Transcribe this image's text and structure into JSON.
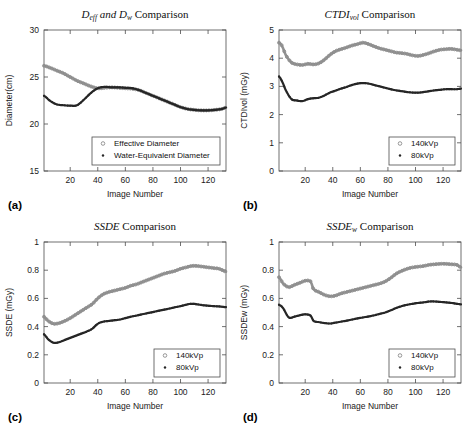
{
  "figure": {
    "panels": [
      "a",
      "b",
      "c",
      "d"
    ],
    "colors": {
      "series_140kvp": "#8c8c8c",
      "series_80kvp": "#262626",
      "effective_diameter": "#8c8c8c",
      "water_equivalent_diameter": "#262626",
      "axis": "#4d4d4d",
      "background": "#ffffff"
    },
    "common": {
      "xlabel": "Image Number",
      "xticks": [
        20,
        40,
        60,
        80,
        100,
        120
      ],
      "xlim": [
        1,
        133
      ]
    }
  },
  "chart_data": [
    {
      "panel_letter": "(a)",
      "type": "line",
      "title": "D_eff and D_w Comparison",
      "title_parts": {
        "main1": "D",
        "sub1": "eff",
        "mid": " and ",
        "main2": "D",
        "sub2": "w",
        "tail": " Comparison"
      },
      "xlabel": "Image Number",
      "ylabel": "Diameter(cm)",
      "xlim": [
        1,
        133
      ],
      "ylim": [
        15,
        30
      ],
      "xticks": [
        20,
        40,
        60,
        80,
        100,
        120
      ],
      "yticks": [
        15,
        20,
        25,
        30
      ],
      "grid": false,
      "legend_position": "lower right",
      "series": [
        {
          "name": "Effective Diameter",
          "marker": "circle",
          "color": "#8c8c8c",
          "x": [
            1,
            5,
            10,
            15,
            20,
            25,
            30,
            35,
            40,
            45,
            50,
            55,
            60,
            65,
            70,
            75,
            80,
            85,
            90,
            95,
            100,
            105,
            110,
            115,
            120,
            125,
            130,
            133
          ],
          "values": [
            26.2,
            26.0,
            25.7,
            25.4,
            25.0,
            24.6,
            24.3,
            24.0,
            23.8,
            23.85,
            23.9,
            23.85,
            23.8,
            23.75,
            23.6,
            23.3,
            23.0,
            22.7,
            22.4,
            22.1,
            21.8,
            21.6,
            21.5,
            21.45,
            21.45,
            21.5,
            21.6,
            21.75
          ]
        },
        {
          "name": "Water-Equivalent Diameter",
          "marker": "dot",
          "color": "#262626",
          "x": [
            1,
            5,
            10,
            15,
            20,
            25,
            30,
            35,
            40,
            45,
            50,
            55,
            60,
            65,
            70,
            75,
            80,
            85,
            90,
            95,
            100,
            105,
            110,
            115,
            120,
            125,
            130,
            133
          ],
          "values": [
            23.0,
            22.5,
            22.1,
            22.0,
            21.95,
            22.0,
            22.6,
            23.3,
            23.8,
            23.95,
            23.9,
            23.9,
            23.85,
            23.8,
            23.6,
            23.3,
            23.0,
            22.7,
            22.4,
            22.1,
            21.8,
            21.6,
            21.5,
            21.45,
            21.45,
            21.5,
            21.6,
            21.75
          ]
        }
      ]
    },
    {
      "panel_letter": "(b)",
      "type": "line",
      "title": "CTDI_vol Comparison",
      "title_parts": {
        "main1": "CTDI",
        "sub1": "vol",
        "tail": " Comparison"
      },
      "xlabel": "Image Number",
      "ylabel": "CTDIvol (mGy)",
      "xlim": [
        1,
        133
      ],
      "ylim": [
        0,
        5
      ],
      "xticks": [
        20,
        40,
        60,
        80,
        100,
        120
      ],
      "yticks": [
        0,
        1,
        2,
        3,
        4,
        5
      ],
      "grid": false,
      "legend_position": "lower right",
      "series": [
        {
          "name": "140kVp",
          "marker": "circle",
          "color": "#8c8c8c",
          "x": [
            1,
            3,
            6,
            10,
            14,
            18,
            22,
            26,
            30,
            34,
            38,
            42,
            46,
            50,
            54,
            58,
            62,
            66,
            70,
            74,
            78,
            82,
            86,
            90,
            94,
            98,
            102,
            106,
            110,
            114,
            118,
            122,
            126,
            130,
            133
          ],
          "values": [
            4.55,
            4.45,
            4.1,
            3.85,
            3.78,
            3.76,
            3.8,
            3.78,
            3.82,
            3.95,
            4.12,
            4.25,
            4.32,
            4.38,
            4.45,
            4.5,
            4.55,
            4.5,
            4.42,
            4.35,
            4.3,
            4.25,
            4.2,
            4.18,
            4.15,
            4.1,
            4.08,
            4.12,
            4.18,
            4.25,
            4.3,
            4.32,
            4.33,
            4.3,
            4.28
          ]
        },
        {
          "name": "80kVp",
          "marker": "dot",
          "color": "#262626",
          "x": [
            1,
            3,
            6,
            10,
            14,
            18,
            22,
            26,
            30,
            34,
            38,
            42,
            46,
            50,
            54,
            58,
            62,
            66,
            70,
            74,
            78,
            82,
            86,
            90,
            94,
            98,
            102,
            106,
            110,
            114,
            118,
            122,
            126,
            130,
            133
          ],
          "values": [
            3.35,
            3.2,
            2.85,
            2.55,
            2.5,
            2.48,
            2.55,
            2.58,
            2.6,
            2.68,
            2.78,
            2.85,
            2.92,
            2.98,
            3.05,
            3.1,
            3.12,
            3.1,
            3.05,
            3.0,
            2.95,
            2.9,
            2.86,
            2.83,
            2.8,
            2.78,
            2.78,
            2.8,
            2.83,
            2.86,
            2.88,
            2.9,
            2.9,
            2.9,
            2.92
          ]
        }
      ]
    },
    {
      "panel_letter": "(c)",
      "type": "line",
      "title": "SSDE Comparison",
      "title_parts": {
        "main1": "SSDE",
        "tail": " Comparison"
      },
      "xlabel": "Image Number",
      "ylabel": "SSDE (mGy)",
      "xlim": [
        1,
        133
      ],
      "ylim": [
        0,
        1
      ],
      "xticks": [
        20,
        40,
        60,
        80,
        100,
        120
      ],
      "yticks": [
        0,
        0.2,
        0.4,
        0.6,
        0.8,
        1
      ],
      "ytick_labels": [
        "0",
        "0.2",
        "0.4",
        "0.6",
        "0.8",
        "1"
      ],
      "grid": false,
      "legend_position": "lower right",
      "series": [
        {
          "name": "140kVp",
          "marker": "circle",
          "color": "#8c8c8c",
          "x": [
            1,
            4,
            8,
            12,
            16,
            20,
            24,
            28,
            32,
            36,
            40,
            44,
            48,
            52,
            56,
            60,
            64,
            68,
            72,
            76,
            80,
            84,
            88,
            92,
            96,
            100,
            104,
            108,
            112,
            116,
            120,
            124,
            128,
            133
          ],
          "values": [
            0.47,
            0.44,
            0.42,
            0.425,
            0.44,
            0.46,
            0.485,
            0.51,
            0.535,
            0.56,
            0.6,
            0.63,
            0.645,
            0.655,
            0.665,
            0.675,
            0.69,
            0.7,
            0.715,
            0.73,
            0.745,
            0.76,
            0.775,
            0.785,
            0.795,
            0.81,
            0.82,
            0.83,
            0.83,
            0.825,
            0.82,
            0.815,
            0.81,
            0.79
          ]
        },
        {
          "name": "80kVp",
          "marker": "dot",
          "color": "#262626",
          "x": [
            1,
            4,
            8,
            12,
            16,
            20,
            24,
            28,
            32,
            36,
            40,
            44,
            48,
            52,
            56,
            60,
            64,
            68,
            72,
            76,
            80,
            84,
            88,
            92,
            96,
            100,
            104,
            108,
            112,
            116,
            120,
            124,
            128,
            133
          ],
          "values": [
            0.345,
            0.31,
            0.285,
            0.29,
            0.305,
            0.32,
            0.335,
            0.35,
            0.365,
            0.385,
            0.42,
            0.435,
            0.44,
            0.445,
            0.45,
            0.46,
            0.47,
            0.478,
            0.487,
            0.495,
            0.503,
            0.512,
            0.52,
            0.528,
            0.537,
            0.545,
            0.555,
            0.562,
            0.558,
            0.552,
            0.548,
            0.545,
            0.543,
            0.538
          ]
        }
      ]
    },
    {
      "panel_letter": "(d)",
      "type": "line",
      "title": "SSDE_w Comparison",
      "title_parts": {
        "main1": "SSDE",
        "sub1": "w",
        "tail": " Comparison"
      },
      "xlabel": "Image Number",
      "ylabel": "SSDEw (mGy)",
      "xlim": [
        1,
        133
      ],
      "ylim": [
        0,
        1
      ],
      "xticks": [
        20,
        40,
        60,
        80,
        100,
        120
      ],
      "yticks": [
        0,
        0.2,
        0.4,
        0.6,
        0.8,
        1
      ],
      "ytick_labels": [
        "0",
        "0.2",
        "0.4",
        "0.6",
        "0.8",
        "1"
      ],
      "grid": false,
      "legend_position": "lower right",
      "series": [
        {
          "name": "140kVp",
          "marker": "circle",
          "color": "#8c8c8c",
          "x": [
            1,
            4,
            8,
            12,
            16,
            20,
            24,
            26,
            30,
            34,
            38,
            42,
            46,
            50,
            54,
            58,
            62,
            66,
            70,
            74,
            78,
            82,
            86,
            90,
            94,
            98,
            102,
            106,
            110,
            114,
            118,
            122,
            126,
            130,
            133
          ],
          "values": [
            0.75,
            0.705,
            0.68,
            0.695,
            0.71,
            0.725,
            0.72,
            0.665,
            0.645,
            0.625,
            0.615,
            0.62,
            0.635,
            0.645,
            0.655,
            0.665,
            0.675,
            0.685,
            0.695,
            0.705,
            0.72,
            0.745,
            0.775,
            0.795,
            0.81,
            0.82,
            0.825,
            0.83,
            0.838,
            0.842,
            0.845,
            0.845,
            0.842,
            0.838,
            0.82
          ]
        },
        {
          "name": "80kVp",
          "marker": "dot",
          "color": "#262626",
          "x": [
            1,
            4,
            8,
            12,
            16,
            20,
            24,
            26,
            30,
            34,
            38,
            42,
            46,
            50,
            54,
            58,
            62,
            66,
            70,
            74,
            78,
            82,
            86,
            90,
            94,
            98,
            102,
            106,
            110,
            114,
            118,
            122,
            126,
            130,
            133
          ],
          "values": [
            0.555,
            0.53,
            0.465,
            0.47,
            0.48,
            0.487,
            0.478,
            0.44,
            0.432,
            0.425,
            0.422,
            0.428,
            0.435,
            0.442,
            0.45,
            0.458,
            0.465,
            0.472,
            0.48,
            0.49,
            0.5,
            0.515,
            0.532,
            0.545,
            0.555,
            0.562,
            0.568,
            0.572,
            0.578,
            0.578,
            0.575,
            0.572,
            0.568,
            0.562,
            0.558
          ]
        }
      ]
    }
  ]
}
